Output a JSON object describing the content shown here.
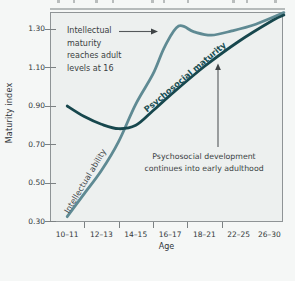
{
  "figure": {
    "x_axis_title": "Age",
    "y_axis_title": "Maturity index"
  },
  "chart_data": {
    "type": "line",
    "title": "",
    "xlabel": "Age",
    "ylabel": "Maturity index",
    "categories": [
      "10–11",
      "12–13",
      "14–15",
      "16–17",
      "18–21",
      "22–25",
      "26–30"
    ],
    "y_tick_labels": [
      "0.30",
      "0.50",
      "0.70",
      "0.90",
      "1.10",
      "1.30"
    ],
    "ylim": [
      0.3,
      1.39
    ],
    "grid": false,
    "legend_position": "labels-on-curves",
    "series": [
      {
        "name": "Intellectual ability",
        "color": "#5f8a93",
        "values": [
          0.33,
          0.57,
          0.91,
          1.31,
          1.27,
          1.3,
          1.36
        ],
        "path": [
          {
            "i": 0.0,
            "v": 0.325
          },
          {
            "i": 0.5,
            "v": 0.445
          },
          {
            "i": 1.0,
            "v": 0.565
          },
          {
            "i": 1.5,
            "v": 0.715
          },
          {
            "i": 2.0,
            "v": 0.91
          },
          {
            "i": 2.5,
            "v": 1.065
          },
          {
            "i": 2.85,
            "v": 1.21
          },
          {
            "i": 3.25,
            "v": 1.315
          },
          {
            "i": 3.7,
            "v": 1.285
          },
          {
            "i": 4.2,
            "v": 1.268
          },
          {
            "i": 4.8,
            "v": 1.29
          },
          {
            "i": 5.5,
            "v": 1.325
          },
          {
            "i": 6.32,
            "v": 1.385
          }
        ]
      },
      {
        "name": "Psychosocial maturity",
        "color": "#17474d",
        "values": [
          0.9,
          0.81,
          0.78,
          0.96,
          1.11,
          1.24,
          1.35
        ],
        "path": [
          {
            "i": 0.0,
            "v": 0.9
          },
          {
            "i": 0.5,
            "v": 0.845
          },
          {
            "i": 1.0,
            "v": 0.805
          },
          {
            "i": 1.5,
            "v": 0.782
          },
          {
            "i": 2.0,
            "v": 0.8
          },
          {
            "i": 2.5,
            "v": 0.875
          },
          {
            "i": 3.0,
            "v": 0.955
          },
          {
            "i": 4.0,
            "v": 1.105
          },
          {
            "i": 5.0,
            "v": 1.235
          },
          {
            "i": 6.0,
            "v": 1.345
          },
          {
            "i": 6.32,
            "v": 1.372
          }
        ]
      }
    ],
    "annotations": [
      {
        "text_lines": [
          "Intellectual",
          "maturity",
          "reaches adult",
          "levels at 16"
        ],
        "arrow": "right-to-intellectual-peak"
      },
      {
        "text_lines": [
          "Psychosocial development",
          "continues into early adulthood"
        ],
        "arrow": "up-to-psychosocial-curve"
      }
    ]
  }
}
